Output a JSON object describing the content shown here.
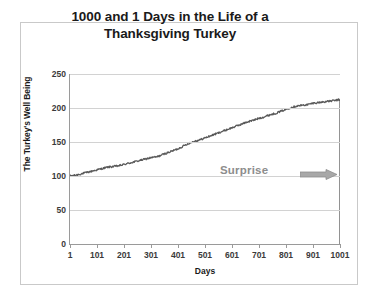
{
  "chart_data": {
    "type": "line",
    "title": "1000 and 1 Days in the Life of a Thanksgiving Turkey",
    "title_line1": "1000 and 1 Days in the Life of a",
    "title_line2": "Thanksgiving Turkey",
    "xlabel": "Days",
    "ylabel": "The Turkey's Well Being",
    "xlim": [
      1,
      1001
    ],
    "ylim": [
      0,
      250
    ],
    "xticks": [
      "1",
      "101",
      "201",
      "301",
      "401",
      "501",
      "601",
      "701",
      "801",
      "901",
      "1001"
    ],
    "yticks": [
      "0",
      "50",
      "100",
      "150",
      "200",
      "250"
    ],
    "grid": "horizontal",
    "legend": "none",
    "series": [
      {
        "name": "The Turkey's Well Being",
        "color": "#595959",
        "x": [
          1,
          21,
          41,
          61,
          81,
          101,
          121,
          141,
          161,
          181,
          201,
          221,
          241,
          261,
          281,
          301,
          321,
          341,
          361,
          381,
          401,
          421,
          441,
          461,
          481,
          501,
          521,
          541,
          561,
          581,
          601,
          621,
          641,
          661,
          681,
          701,
          721,
          741,
          761,
          781,
          801,
          821,
          841,
          861,
          881,
          901,
          921,
          941,
          961,
          981,
          995,
          1000,
          1001
        ],
        "values": [
          100,
          101,
          103,
          105,
          107,
          109,
          111,
          113,
          114,
          115,
          117,
          119,
          121,
          123,
          125,
          127,
          128,
          131,
          134,
          137,
          140,
          144,
          148,
          151,
          153,
          156,
          159,
          162,
          165,
          168,
          171,
          174,
          177,
          180,
          182,
          185,
          187,
          190,
          192,
          195,
          198,
          201,
          203,
          204,
          205,
          207,
          208,
          209,
          210,
          211,
          212,
          212,
          0
        ]
      }
    ],
    "annotations": [
      {
        "text": "Surprise",
        "color": "#8d8d8d",
        "x": 760,
        "y": 125,
        "arrow": "right-arrow-icon",
        "arrow_color": "#9a9a9a"
      }
    ]
  }
}
